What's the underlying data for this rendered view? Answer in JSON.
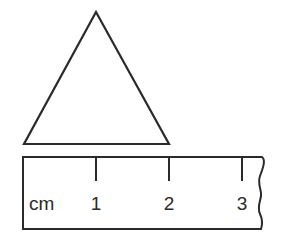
{
  "diagram": {
    "triangle": {
      "shape": "equilateral-triangle",
      "vertices": [
        [
          96,
          12
        ],
        [
          24,
          144
        ],
        [
          169,
          144
        ]
      ],
      "stroke_color": "#2a2a2a"
    },
    "ruler": {
      "unit_label": "cm",
      "ticks": [
        {
          "label": "1",
          "x": 96
        },
        {
          "label": "2",
          "x": 169
        },
        {
          "label": "3",
          "x": 242
        }
      ],
      "stroke_color": "#2a2a2a"
    }
  }
}
